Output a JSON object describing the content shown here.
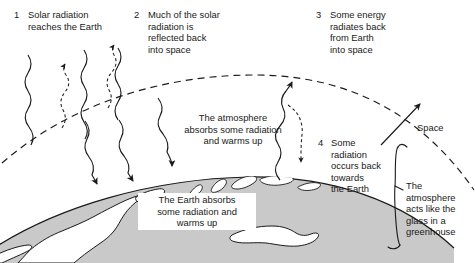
{
  "diagram": {
    "background_color": "#ffffff",
    "ink_color": "#1a1a1a",
    "earth_fill": "#c9c9c9",
    "land_fill": "#ffffff"
  },
  "steps": [
    {
      "number": "1",
      "text": "Solar radiation\nreaches the Earth"
    },
    {
      "number": "2",
      "text": "Much of the solar\nradiation is\nreflected back\ninto space"
    },
    {
      "number": "3",
      "text": "Some energy\nradiates back\nfrom Earth\ninto space"
    },
    {
      "number": "4",
      "text": "Some\nradiation\noccurs back\ntowards\nthe Earth"
    }
  ],
  "annotations": {
    "atmosphere_absorbs": "The atmosphere\nabsorbs some radiation\nand warms up",
    "earth_absorbs": "The Earth absorbs\nsome radiation and\nwarms up",
    "space": "Space",
    "greenhouse_brace": "The\natmosphere\nacts like the\nglass in a\ngreenhouse"
  }
}
